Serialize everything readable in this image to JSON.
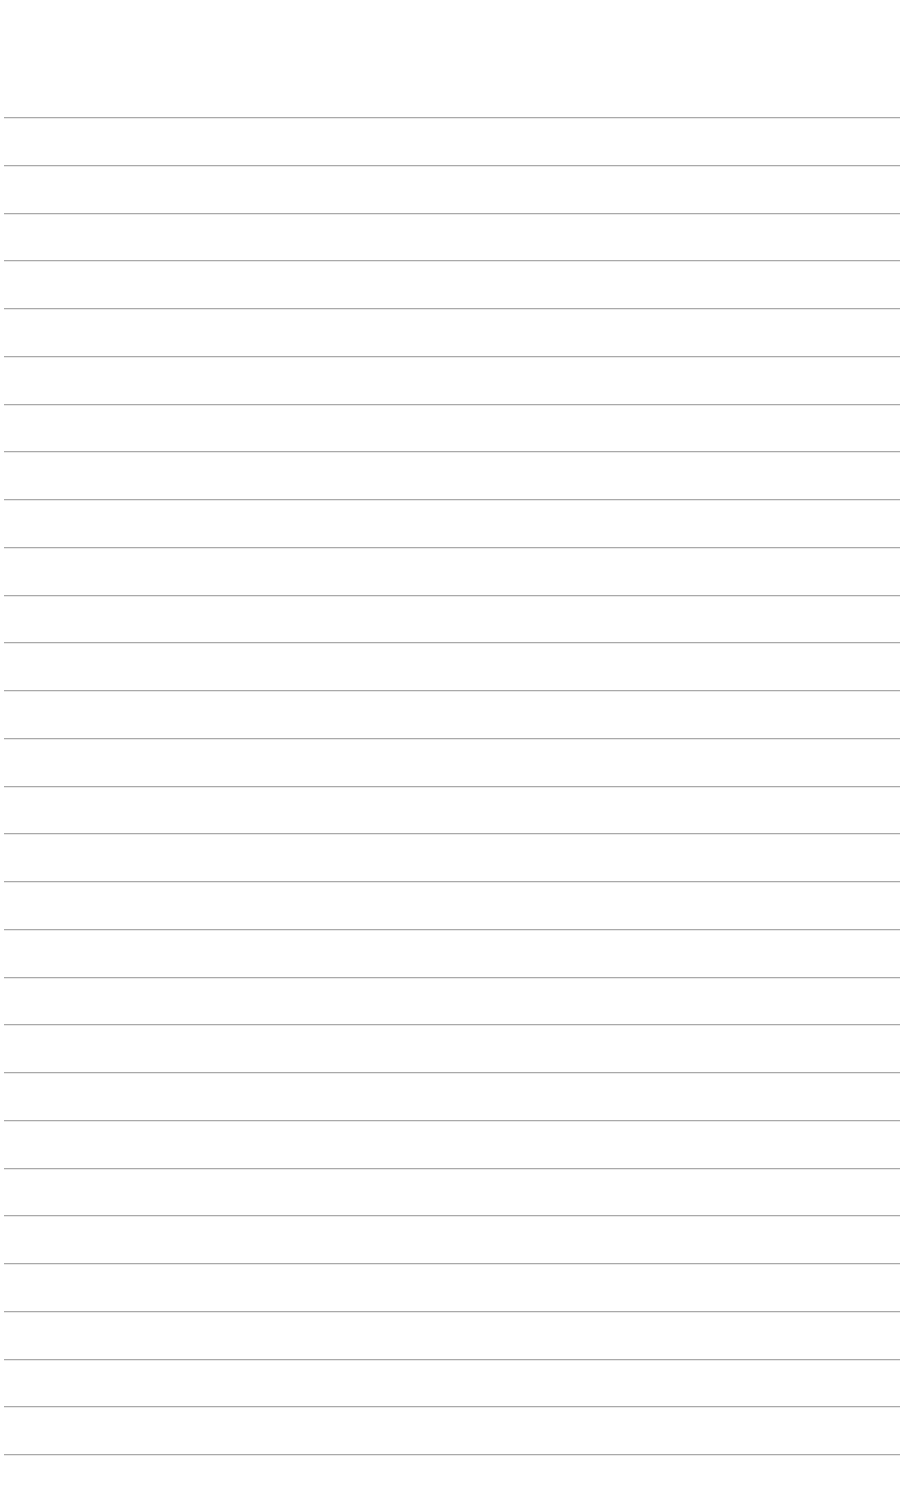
{
  "page": {
    "type": "blank-lined-paper",
    "background_color": "#ffffff",
    "line_color": "#a9a9a9",
    "line_count": 29,
    "first_line_y": 117,
    "line_spacing": 47.75,
    "text_content": ""
  }
}
